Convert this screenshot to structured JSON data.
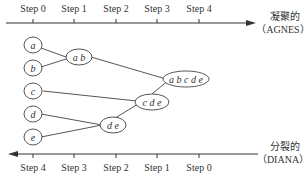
{
  "top_axis": {
    "steps": [
      "Step 0",
      "Step 1",
      "Step 2",
      "Step 3",
      "Step 4"
    ],
    "label_line1": "凝聚的",
    "label_line2": "（AGNES）"
  },
  "bottom_axis": {
    "steps": [
      "Step 4",
      "Step 3",
      "Step 2",
      "Step 1",
      "Step 0"
    ],
    "label_line1": "分裂的",
    "label_line2": "（DIANA）"
  },
  "nodes": {
    "a": "a",
    "b": "b",
    "c": "c",
    "d": "d",
    "e": "e",
    "ab": "a b",
    "de": "d e",
    "cde": "c d e",
    "abcde": "a b c d e"
  }
}
